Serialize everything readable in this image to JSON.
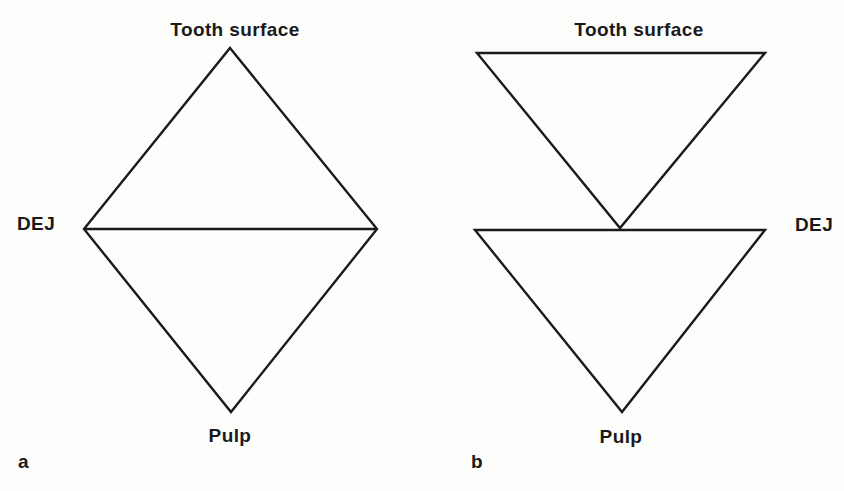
{
  "figure": {
    "background_color": "#fdfdfc",
    "line_color": "#1b1b1b",
    "text_color": "#1a1a1a",
    "diagram_a": {
      "panel_letter": "a",
      "shape": "diamond: triangle from tooth surface widening to DEJ, then converging to pulp",
      "labels": {
        "top": "Tooth surface",
        "left": "DEJ",
        "bottom": "Pulp"
      }
    },
    "diagram_b": {
      "panel_letter": "b",
      "shape": "two inverted triangles: wide at tooth surface converging to DEJ, wide at DEJ converging to pulp",
      "labels": {
        "top": "Tooth surface",
        "right": "DEJ",
        "bottom": "Pulp"
      }
    }
  }
}
